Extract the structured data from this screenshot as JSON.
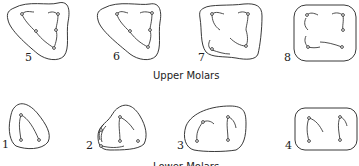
{
  "diagram": {
    "sections": [
      {
        "id": "upper",
        "caption": "Upper Molars",
        "teeth": [
          {
            "label": "5",
            "shape": "triangular"
          },
          {
            "label": "6",
            "shape": "triangular"
          },
          {
            "label": "7",
            "shape": "rounded-square"
          },
          {
            "label": "8",
            "shape": "square"
          }
        ]
      },
      {
        "id": "lower",
        "caption": "Lower Molars",
        "teeth": [
          {
            "label": "1",
            "shape": "teardrop"
          },
          {
            "label": "2",
            "shape": "teardrop-extended"
          },
          {
            "label": "3",
            "shape": "oval"
          },
          {
            "label": "4",
            "shape": "rounded-rectangle"
          }
        ]
      }
    ]
  }
}
